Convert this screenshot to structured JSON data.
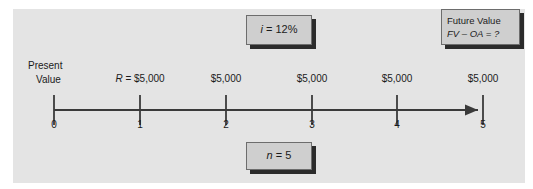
{
  "figure": {
    "background_color": "#e4e4e4",
    "ink_color": "#1b1b1b"
  },
  "callouts": {
    "rate": {
      "text": "i = 12%",
      "variable": "i",
      "value": "12%"
    },
    "periods": {
      "text": "n = 5",
      "variable": "n",
      "value": "5"
    },
    "future_value": {
      "line1": "Future Value",
      "line2": "FV – OA = ?",
      "variable": "FV – OA",
      "value": "?"
    }
  },
  "left_label": {
    "line1": "Present",
    "line2": "Value"
  },
  "timeline": {
    "tick_labels": [
      "0",
      "1",
      "2",
      "3",
      "4",
      "5"
    ],
    "amount_labels": [
      "R = $5,000",
      "$5,000",
      "$5,000",
      "$5,000",
      "$5,000"
    ],
    "rent_symbol": "R",
    "rent_amount": "$5,000",
    "arrow_direction": "right"
  },
  "chart_data": {
    "type": "table",
    "xlabel": "Period",
    "ylabel": "Cash flow",
    "categories": [
      "0",
      "1",
      "2",
      "3",
      "4",
      "5"
    ],
    "values": [
      0,
      5000,
      5000,
      5000,
      5000,
      5000
    ],
    "interest_rate": 0.12,
    "n_periods": 5,
    "unknown": "FV – OA",
    "annotations": [
      "i = 12%",
      "n = 5",
      "FV – OA = ?",
      "Present Value",
      "R = $5,000"
    ]
  }
}
